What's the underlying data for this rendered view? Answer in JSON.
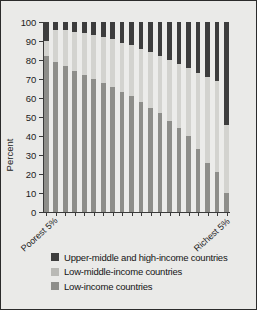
{
  "chart_data": {
    "type": "bar",
    "subtype": "stacked-100-percent",
    "title": "",
    "xlabel": "",
    "ylabel": "Percent",
    "ylim": [
      0,
      100
    ],
    "yticks": [
      0,
      10,
      20,
      30,
      40,
      50,
      60,
      70,
      80,
      90,
      100
    ],
    "grid": false,
    "legend_position": "bottom-left",
    "x_axis_endpoint_labels": {
      "left": "Poorest 5%",
      "right": "Richest 5%"
    },
    "categories": [
      "Poorest 5%",
      "2",
      "3",
      "4",
      "5",
      "6",
      "7",
      "8",
      "9",
      "10",
      "11",
      "12",
      "13",
      "14",
      "15",
      "16",
      "17",
      "18",
      "19",
      "Richest 5%"
    ],
    "series": [
      {
        "name": "Low-income countries",
        "color": "#8e8e8a",
        "stack_order": 1,
        "values": [
          82,
          79,
          77,
          74,
          72,
          70,
          68,
          66,
          63,
          61,
          58,
          55,
          52,
          48,
          44,
          40,
          33,
          26,
          21,
          10
        ]
      },
      {
        "name": "Low-middle-income countries",
        "color": "#d3d3cf",
        "stack_order": 2,
        "values": [
          8,
          17,
          19,
          21,
          22,
          23,
          24,
          25,
          26,
          27,
          28,
          29,
          30,
          32,
          34,
          36,
          40,
          45,
          48,
          36
        ]
      },
      {
        "name": "Upper-middle and high-income countries",
        "color": "#3d3d3d",
        "stack_order": 3,
        "values": [
          10,
          4,
          4,
          5,
          6,
          7,
          8,
          9,
          11,
          12,
          14,
          16,
          18,
          20,
          22,
          24,
          27,
          29,
          31,
          54
        ]
      }
    ],
    "legend": [
      {
        "label": "Upper-middle and high-income countries",
        "color": "#3d3d3d"
      },
      {
        "label": "Low-middle-income countries",
        "color": "#b9b9b5"
      },
      {
        "label": "Low-income countries",
        "color": "#8e8e8a"
      }
    ]
  }
}
